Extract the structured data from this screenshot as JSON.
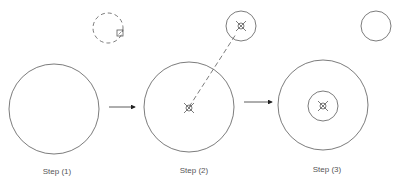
{
  "diagram": {
    "stroke_color": "#5a5a5a",
    "label_color": "#555555",
    "steps": [
      {
        "label": "Step (1)",
        "label_pos": [
          57,
          167
        ],
        "big_circle": {
          "cx": 54,
          "cy": 109,
          "r": 45
        },
        "tool_circle": {
          "cx": 108,
          "cy": 28,
          "r": 15,
          "dashed": true
        },
        "handle_square": {
          "x": 117,
          "y": 30,
          "size": 6
        }
      },
      {
        "label": "Step (2)",
        "label_pos": [
          194,
          166
        ],
        "big_circle": {
          "cx": 189,
          "cy": 107,
          "r": 45
        },
        "tool_circle": {
          "cx": 241,
          "cy": 26,
          "r": 15
        },
        "center_marker": {
          "cx": 189,
          "cy": 108
        },
        "tool_marker": {
          "cx": 241,
          "cy": 26
        },
        "move_line": {
          "x1": 189,
          "y1": 107,
          "x2": 236,
          "y2": 34,
          "dashed": true
        }
      },
      {
        "label": "Step (3)",
        "label_pos": [
          327,
          165
        ],
        "big_circle": {
          "cx": 323,
          "cy": 105,
          "r": 45
        },
        "inner_circle": {
          "cx": 323,
          "cy": 106,
          "r": 15
        },
        "center_marker": {
          "cx": 323,
          "cy": 106
        },
        "ghost_circle": {
          "cx": 376,
          "cy": 26,
          "r": 15
        }
      }
    ],
    "arrows": [
      {
        "x1": 109,
        "y1": 107,
        "x2": 135,
        "y2": 107
      },
      {
        "x1": 244,
        "y1": 102,
        "x2": 272,
        "y2": 102
      }
    ]
  }
}
